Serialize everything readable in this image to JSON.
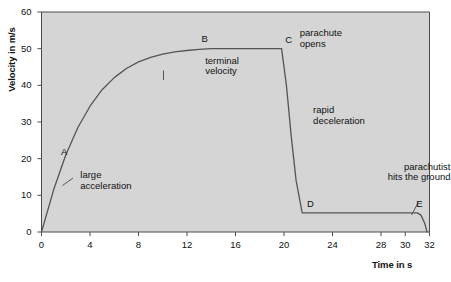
{
  "chart_data": {
    "type": "line",
    "title": "",
    "xlabel": "Time in s",
    "ylabel": "Velocity in m/s",
    "xlim": [
      0,
      32
    ],
    "ylim": [
      0,
      60
    ],
    "grid": false,
    "legend": "none",
    "xticks": [
      "0",
      "4",
      "8",
      "12",
      "16",
      "20",
      "24",
      "28",
      "30",
      "32"
    ],
    "xtick_values": [
      0,
      4,
      8,
      12,
      16,
      20,
      24,
      28,
      30,
      32
    ],
    "yticks": [
      "0",
      "10",
      "20",
      "30",
      "40",
      "50",
      "60"
    ],
    "ytick_values": [
      0,
      10,
      20,
      30,
      40,
      50,
      60
    ],
    "series": [
      {
        "name": "parachutist velocity",
        "x": [
          0,
          1,
          2,
          3,
          4,
          5,
          6,
          7,
          8,
          9,
          10,
          11,
          12,
          13,
          14,
          16,
          18,
          19.8,
          20.2,
          20.6,
          21.0,
          21.5,
          24,
          28,
          31.0,
          31.3,
          31.6,
          31.8
        ],
        "y": [
          0,
          11.5,
          21.0,
          28.5,
          34.3,
          38.8,
          42.1,
          44.6,
          46.4,
          47.6,
          48.5,
          49.1,
          49.5,
          49.8,
          50.0,
          50.0,
          50.0,
          50.0,
          40.0,
          26.0,
          14.0,
          5.2,
          5.2,
          5.2,
          5.2,
          4.6,
          2.4,
          0
        ]
      }
    ],
    "annotations": [
      {
        "name": "point-a",
        "label": "A",
        "x": 1.6,
        "y": 21.5
      },
      {
        "name": "point-b",
        "label": "B",
        "x": 13.2,
        "y": 52.4
      },
      {
        "name": "point-c",
        "label": "C",
        "x": 20.1,
        "y": 52.2
      },
      {
        "name": "point-d",
        "label": "D",
        "x": 21.9,
        "y": 7.4
      },
      {
        "name": "point-e",
        "label": "E",
        "x": 30.9,
        "y": 7.4
      },
      {
        "name": "large-acceleration",
        "label": "large\nacceleration",
        "x": 3.2,
        "y": 15.2
      },
      {
        "name": "terminal-velocity",
        "label": "terminal\nvelocity",
        "x": 13.5,
        "y": 46.5
      },
      {
        "name": "parachute-opens",
        "label": "parachute\nopens",
        "x": 21.3,
        "y": 54.0
      },
      {
        "name": "rapid-deceleration",
        "label": "rapid\ndeceleration",
        "x": 22.4,
        "y": 33.0
      },
      {
        "name": "parachutist-hits-the-ground",
        "label": "parachutist\nhits the ground",
        "x": 30.6,
        "y": 17.5
      }
    ],
    "colors": {
      "plot_background": "#d5d5d5",
      "curve": "#555555",
      "axis": "#4c4c4c",
      "text": "#111111",
      "page_background": "#ffffff"
    }
  },
  "caption": ""
}
